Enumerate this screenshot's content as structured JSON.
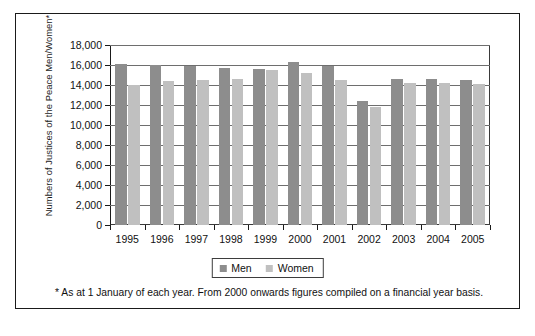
{
  "figure": {
    "y_axis_title": "Numbers of Justices of the Peace Men/Women*",
    "footnote": "* As at 1 January of each year. From 2000 onwards figures compiled on a financial year basis."
  },
  "legend": {
    "men_label": "Men",
    "women_label": "Women"
  },
  "colors": {
    "men": "#8d8d8d",
    "women": "#c0c0c0",
    "frame": "#1a1a1a",
    "gridline": "#6e6e6e"
  },
  "chart_data": {
    "type": "bar",
    "title": "",
    "subtitle": "",
    "xlabel": "",
    "ylabel": "Numbers of Justices of the Peace Men/Women*",
    "categories": [
      "1995",
      "1996",
      "1997",
      "1998",
      "1999",
      "2000",
      "2001",
      "2002",
      "2003",
      "2004",
      "2005"
    ],
    "series": [
      {
        "name": "Men",
        "color": "#8d8d8d",
        "values": [
          16100,
          16000,
          15950,
          15750,
          15600,
          16300,
          15900,
          12400,
          14600,
          14650,
          14500
        ]
      },
      {
        "name": "Women",
        "color": "#c0c0c0",
        "values": [
          14050,
          14400,
          14500,
          14650,
          15500,
          15200,
          14500,
          11800,
          14200,
          14200,
          14150
        ]
      }
    ],
    "ylim": [
      0,
      18000
    ],
    "ytick_values": [
      0,
      2000,
      4000,
      6000,
      8000,
      10000,
      12000,
      14000,
      16000,
      18000
    ],
    "ytick_labels": [
      "0",
      "2,000",
      "4,000",
      "6,000",
      "8,000",
      "10,000",
      "12,000",
      "14,000",
      "16,000",
      "18,000"
    ],
    "grid": true,
    "legend_position": "bottom",
    "annotations": [
      "* As at 1 January of each year. From 2000 onwards figures compiled on a financial year basis."
    ]
  }
}
